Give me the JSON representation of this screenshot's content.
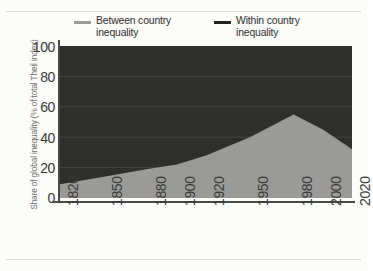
{
  "chart_data": {
    "type": "area",
    "title": "",
    "subtitle": "",
    "xlabel": "",
    "ylabel": "Share of global inequality (% of total Theil index)",
    "stacked": true,
    "stack_total": 100,
    "grid": true,
    "legend_position": "top",
    "xlim": [
      1820,
      2020
    ],
    "ylim": [
      0,
      100
    ],
    "x_tick_labels": [
      "1820",
      "1850",
      "1880",
      "1900",
      "1920",
      "1950",
      "1980",
      "2000",
      "2020"
    ],
    "y_tick_labels": [
      "0",
      "20",
      "40",
      "60",
      "80",
      "100"
    ],
    "y_ticks": [
      0,
      20,
      40,
      60,
      80,
      100
    ],
    "x": [
      1820,
      1850,
      1880,
      1900,
      1920,
      1950,
      1980,
      2000,
      2020
    ],
    "series": [
      {
        "name": "Between country inequality",
        "color": "#9a9a98",
        "values": [
          9,
          14,
          19,
          22,
          28,
          40,
          55,
          45,
          32
        ]
      },
      {
        "name": "Within country inequality",
        "color": "#2e2e2c",
        "values": [
          91,
          86,
          81,
          78,
          72,
          60,
          45,
          55,
          68
        ]
      }
    ]
  },
  "legend": {
    "entries": [
      {
        "label": "Between country inequality",
        "color": "#9a9a98"
      },
      {
        "label": "Within country inequality",
        "color": "#222220"
      }
    ]
  },
  "axes": {
    "y_title": "Share of global inequality (% of total Theil index)"
  },
  "colors": {
    "between": "#9a9a98",
    "within": "#2e2e2c",
    "axis": "#4a4a48",
    "grid": "#6a6a68",
    "text": "#3a3a38",
    "page": "#fcfcfb"
  }
}
